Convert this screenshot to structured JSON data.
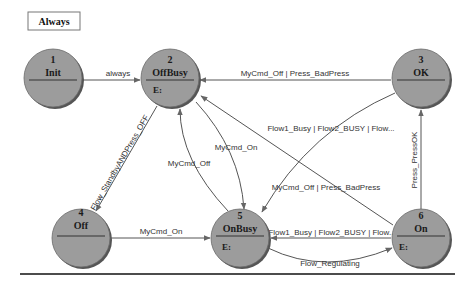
{
  "diagram": {
    "title": "Always",
    "colors": {
      "node_fill": "#9c9c9c",
      "node_shadow": "#555555",
      "edge": "#555555",
      "text": "#1a1a1a"
    },
    "nodes": [
      {
        "id": "1",
        "number": "1",
        "name": "Init",
        "entry": ""
      },
      {
        "id": "2",
        "number": "2",
        "name": "OffBusy",
        "entry": "E:"
      },
      {
        "id": "3",
        "number": "3",
        "name": "OK",
        "entry": ""
      },
      {
        "id": "4",
        "number": "4",
        "name": "Off",
        "entry": ""
      },
      {
        "id": "5",
        "number": "5",
        "name": "OnBusy",
        "entry": "E:"
      },
      {
        "id": "6",
        "number": "6",
        "name": "On",
        "entry": "E:"
      }
    ],
    "edges": [
      {
        "from": "1",
        "to": "2",
        "label": "always"
      },
      {
        "from": "3",
        "to": "2",
        "label": "MyCmd_Off | Press_BadPress"
      },
      {
        "from": "2",
        "to": "4",
        "label": "Flow_StandbyANDPress_OFF"
      },
      {
        "from": "5",
        "to": "2",
        "label": "MyCmd_Off"
      },
      {
        "from": "2",
        "to": "5",
        "label": "MyCmd_On"
      },
      {
        "from": "3",
        "to": "5",
        "label": "Flow1_Busy | Flow2_BUSY | Flow..."
      },
      {
        "from": "6",
        "to": "2",
        "label": "MyCmd_Off | Press_BadPress"
      },
      {
        "from": "6",
        "to": "3",
        "label": "Press_PressOK"
      },
      {
        "from": "4",
        "to": "5",
        "label": "MyCmd_On"
      },
      {
        "from": "6",
        "to": "5",
        "label": "Flow1_Busy | Flow2_BUSY | Flow..."
      },
      {
        "from": "5",
        "to": "6",
        "label": "Flow_Regulating"
      }
    ]
  }
}
